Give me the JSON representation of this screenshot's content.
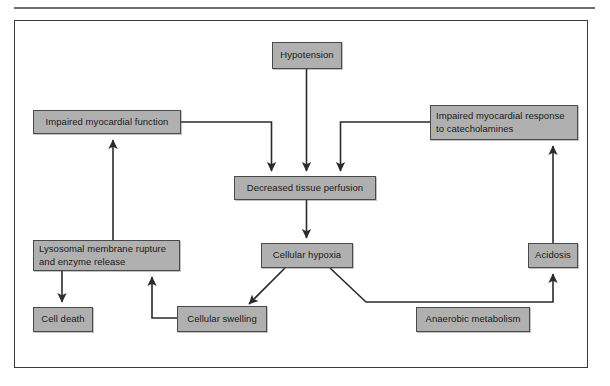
{
  "figure": {
    "type": "flowchart",
    "border_color": "#3a3a3a",
    "node_fill_color": "#b0b0b0",
    "node_border_color": "#4a4a4a",
    "edge_color": "#2b2b2b",
    "background_color": "#ffffff"
  },
  "nodes": {
    "hypotension": {
      "label": "Hypotension"
    },
    "impaired_myocardial_function": {
      "label": "Impaired myocardial function"
    },
    "impaired_myocardial_response": {
      "label": "Impaired myocardial response\nto catecholamines"
    },
    "decreased_tissue_perfusion": {
      "label": "Decreased tissue perfusion"
    },
    "cellular_hypoxia": {
      "label": "Cellular  hypoxia"
    },
    "lysosomal_membrane_rupture": {
      "label": "Lysosomal membrane rupture\nand enzyme release"
    },
    "cell_death": {
      "label": "Cell death"
    },
    "cellular_swelling": {
      "label": "Cellular swelling"
    },
    "anaerobic_metabolism": {
      "label": "Anaerobic metabolism"
    },
    "acidosis": {
      "label": "Acidosis"
    }
  },
  "edges": [
    {
      "from": "hypotension",
      "to": "decreased_tissue_perfusion",
      "style": "straight-down",
      "arrow": true
    },
    {
      "from": "impaired_myocardial_function",
      "to": "decreased_tissue_perfusion",
      "style": "elbow-right-down",
      "arrow": true
    },
    {
      "from": "impaired_myocardial_response",
      "to": "decreased_tissue_perfusion",
      "style": "elbow-left-down",
      "arrow": true
    },
    {
      "from": "decreased_tissue_perfusion",
      "to": "cellular_hypoxia",
      "style": "straight-down",
      "arrow": true
    },
    {
      "from": "cellular_hypoxia",
      "to": "cellular_swelling",
      "style": "diagonal-down-left",
      "arrow": true
    },
    {
      "from": "cellular_hypoxia",
      "to": "acidosis",
      "style": "diagonal-then-right-then-up",
      "arrow": true
    },
    {
      "from": "cellular_swelling",
      "to": "lysosomal_membrane_rupture",
      "style": "elbow-left-up",
      "arrow": true
    },
    {
      "from": "lysosomal_membrane_rupture",
      "to": "cell_death",
      "style": "straight-down",
      "arrow": true
    },
    {
      "from": "lysosomal_membrane_rupture",
      "to": "impaired_myocardial_function",
      "style": "straight-up",
      "arrow": true
    },
    {
      "from": "acidosis",
      "to": "impaired_myocardial_response",
      "style": "straight-up",
      "arrow": true
    }
  ]
}
